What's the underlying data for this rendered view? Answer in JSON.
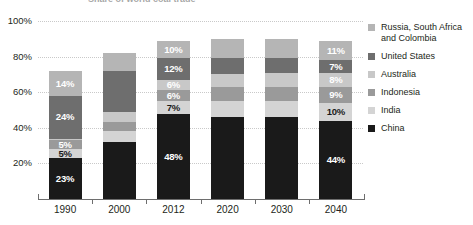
{
  "chart_data": {
    "type": "bar",
    "subtype": "stacked-bar-100",
    "title": "Share of world coal trade",
    "xlabel": "",
    "ylabel": "",
    "ylim": [
      0,
      100
    ],
    "ytick_labels": [
      "20%",
      "40%",
      "60%",
      "80%",
      "100%"
    ],
    "ytick_values": [
      20,
      40,
      60,
      80,
      100
    ],
    "grid": true,
    "legend_position": "right",
    "categories": [
      "1990",
      "2000",
      "2012",
      "2020",
      "2030",
      "2040"
    ],
    "series": [
      {
        "name": "China",
        "color": "#1a1a1a",
        "label_color": "light",
        "values": [
          23,
          32,
          48,
          46,
          46,
          44
        ],
        "labels": [
          "23%",
          "",
          "48%",
          "",
          "",
          "44%"
        ]
      },
      {
        "name": "India",
        "color": "#d4d4d4",
        "label_color": "dark",
        "values": [
          5,
          6,
          7,
          9,
          9,
          10
        ],
        "labels": [
          "5%",
          "",
          "7%",
          "",
          "",
          "10%"
        ]
      },
      {
        "name": "Indonesia",
        "color": "#9a9a9a",
        "label_color": "light",
        "values": [
          5,
          5,
          6,
          8,
          8,
          9
        ],
        "labels": [
          "5%",
          "",
          "6%",
          "",
          "",
          "9%"
        ]
      },
      {
        "name": "Australia",
        "color": "#c8c8c8",
        "label_color": "light",
        "values": [
          1,
          6,
          6,
          7,
          8,
          8
        ],
        "labels": [
          "",
          "",
          "6%",
          "",
          "",
          "8%"
        ]
      },
      {
        "name": "United States",
        "color": "#6e6e6e",
        "label_color": "light",
        "values": [
          24,
          23,
          12,
          9,
          8,
          7
        ],
        "labels": [
          "24%",
          "",
          "12%",
          "",
          "",
          "7%"
        ]
      },
      {
        "name": "Russia, South Africa and Colombia",
        "color": "#b5b5b5",
        "label_color": "light",
        "values": [
          14,
          10,
          10,
          11,
          11,
          11
        ],
        "labels": [
          "14%",
          "",
          "10%",
          "",
          "",
          "11%"
        ]
      }
    ],
    "legend_entries": [
      {
        "label": "Russia, South Africa and Colombia",
        "color": "#b5b5b5"
      },
      {
        "label": "United States",
        "color": "#6e6e6e"
      },
      {
        "label": "Australia",
        "color": "#c8c8c8"
      },
      {
        "label": "Indonesia",
        "color": "#9a9a9a"
      },
      {
        "label": "India",
        "color": "#d4d4d4"
      },
      {
        "label": "China",
        "color": "#1a1a1a"
      }
    ]
  }
}
